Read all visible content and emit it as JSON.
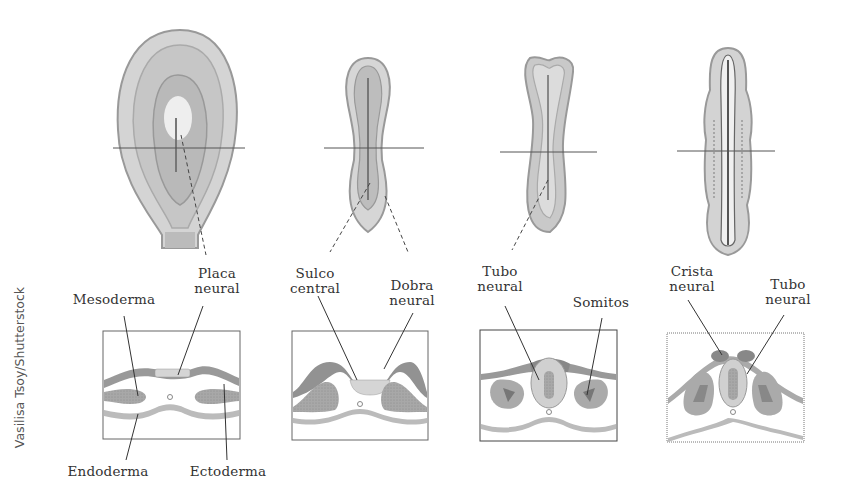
{
  "credit": "Vasilisa Tsoy/Shutterstock",
  "stages": [
    {
      "labels": [
        {
          "text1": "Placa",
          "text2": "neural"
        },
        {
          "text1": "Mesoderma",
          "text2": ""
        },
        {
          "text1": "Endoderma",
          "text2": ""
        },
        {
          "text1": "Ectoderma",
          "text2": ""
        }
      ]
    },
    {
      "labels": [
        {
          "text1": "Sulco",
          "text2": "central"
        },
        {
          "text1": "Dobra",
          "text2": "neural"
        }
      ]
    },
    {
      "labels": [
        {
          "text1": "Tubo",
          "text2": "neural"
        },
        {
          "text1": "Somitos",
          "text2": ""
        }
      ]
    },
    {
      "labels": [
        {
          "text1": "Crista",
          "text2": "neural"
        },
        {
          "text1": "Tubo",
          "text2": "neural"
        }
      ]
    }
  ],
  "colors": {
    "dark": "#8a8a8a",
    "mid": "#a9a9a9",
    "light": "#cfcfcf",
    "pale": "#e6e6e6",
    "line": "#444444"
  }
}
